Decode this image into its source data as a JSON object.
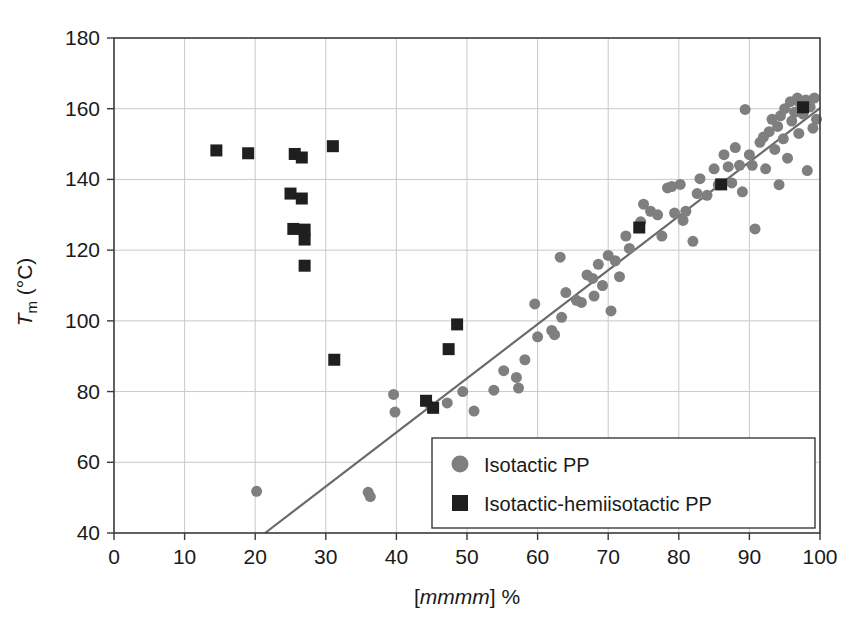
{
  "chart_data": {
    "type": "scatter",
    "title": "",
    "xlabel": "[mmmm] %",
    "xlabel_italic_part": "mmmm",
    "ylabel": "Tm (°C)",
    "ylabel_main": "T",
    "ylabel_subscript": "m",
    "ylabel_unit": "(°C)",
    "xlim": [
      0,
      100
    ],
    "ylim": [
      40,
      180
    ],
    "xticks": [
      0,
      10,
      20,
      30,
      40,
      50,
      60,
      70,
      80,
      90,
      100
    ],
    "yticks": [
      40,
      60,
      80,
      100,
      120,
      140,
      160,
      180
    ],
    "grid": true,
    "grid_color": "#c9c9c9",
    "frame_color": "#3a3a3a",
    "legend_position": "bottom-right",
    "series": [
      {
        "name": "Isotactic PP",
        "marker": "circle",
        "color": "#7f7f7f",
        "marker_size": 11,
        "points": [
          [
            20.2,
            51.8
          ],
          [
            36.0,
            51.5
          ],
          [
            36.3,
            50.3
          ],
          [
            39.6,
            79.2
          ],
          [
            39.8,
            74.2
          ],
          [
            44.8,
            76.0
          ],
          [
            47.2,
            76.8
          ],
          [
            49.4,
            80.0
          ],
          [
            53.8,
            80.4
          ],
          [
            55.2,
            85.9
          ],
          [
            57.0,
            84.0
          ],
          [
            57.3,
            81.0
          ],
          [
            58.2,
            89.0
          ],
          [
            59.6,
            104.8
          ],
          [
            60.0,
            95.5
          ],
          [
            62.0,
            97.3
          ],
          [
            62.4,
            96.1
          ],
          [
            63.2,
            118.0
          ],
          [
            63.4,
            101.0
          ],
          [
            64.0,
            108.0
          ],
          [
            65.5,
            105.8
          ],
          [
            66.2,
            105.2
          ],
          [
            67.0,
            113.0
          ],
          [
            67.8,
            112.0
          ],
          [
            68.6,
            116.0
          ],
          [
            69.2,
            110.0
          ],
          [
            70.0,
            118.5
          ],
          [
            70.4,
            102.8
          ],
          [
            71.0,
            117.0
          ],
          [
            71.6,
            112.5
          ],
          [
            72.5,
            124.0
          ],
          [
            73.0,
            120.5
          ],
          [
            74.6,
            128.0
          ],
          [
            75.0,
            133.0
          ],
          [
            76.0,
            131.0
          ],
          [
            77.0,
            130.0
          ],
          [
            77.6,
            124.0
          ],
          [
            78.4,
            137.6
          ],
          [
            79.0,
            138.0
          ],
          [
            79.4,
            130.5
          ],
          [
            80.2,
            138.6
          ],
          [
            80.6,
            128.4
          ],
          [
            81.0,
            131.0
          ],
          [
            82.0,
            122.5
          ],
          [
            83.0,
            140.2
          ],
          [
            84.0,
            135.5
          ],
          [
            85.0,
            143.0
          ],
          [
            85.6,
            138.5
          ],
          [
            86.4,
            147.0
          ],
          [
            87.0,
            143.6
          ],
          [
            87.5,
            139.0
          ],
          [
            88.0,
            149.0
          ],
          [
            88.6,
            144.0
          ],
          [
            89.0,
            136.5
          ],
          [
            89.4,
            159.8
          ],
          [
            90.0,
            147.0
          ],
          [
            90.4,
            144.0
          ],
          [
            90.8,
            126.0
          ],
          [
            91.5,
            150.5
          ],
          [
            92.0,
            152.0
          ],
          [
            92.3,
            143.0
          ],
          [
            92.8,
            153.5
          ],
          [
            93.2,
            157.0
          ],
          [
            93.6,
            148.5
          ],
          [
            94.0,
            155.0
          ],
          [
            94.4,
            158.0
          ],
          [
            94.8,
            151.5
          ],
          [
            95.0,
            160.0
          ],
          [
            95.4,
            146.0
          ],
          [
            95.8,
            162.0
          ],
          [
            96.0,
            156.5
          ],
          [
            96.4,
            159.0
          ],
          [
            96.8,
            163.0
          ],
          [
            97.0,
            153.0
          ],
          [
            97.2,
            161.5
          ],
          [
            97.6,
            158.5
          ],
          [
            98.0,
            162.5
          ],
          [
            98.2,
            142.5
          ],
          [
            98.6,
            160.5
          ],
          [
            99.0,
            154.5
          ],
          [
            99.2,
            163.0
          ],
          [
            99.5,
            157.0
          ],
          [
            94.2,
            138.5
          ],
          [
            82.6,
            136.0
          ],
          [
            68.0,
            107.0
          ],
          [
            51.0,
            74.5
          ]
        ]
      },
      {
        "name": "Isotactic-hemiisotactic PP",
        "marker": "square",
        "color": "#1f1f1f",
        "marker_size": 12,
        "points": [
          [
            14.5,
            148.2
          ],
          [
            19.0,
            147.4
          ],
          [
            25.6,
            147.2
          ],
          [
            26.6,
            146.2
          ],
          [
            31.0,
            149.4
          ],
          [
            25.0,
            136.0
          ],
          [
            26.6,
            134.6
          ],
          [
            25.4,
            126.0
          ],
          [
            27.0,
            125.8
          ],
          [
            27.0,
            123.0
          ],
          [
            27.0,
            115.6
          ],
          [
            31.2,
            89.0
          ],
          [
            48.6,
            99.0
          ],
          [
            47.4,
            92.0
          ],
          [
            44.2,
            77.4
          ],
          [
            45.2,
            75.4
          ],
          [
            74.4,
            126.4
          ],
          [
            86.0,
            138.6
          ],
          [
            97.6,
            160.4
          ]
        ]
      }
    ],
    "trendline": {
      "x_start": 21.4,
      "y_start": 40,
      "x_end": 100.0,
      "y_end": 160.2,
      "color": "#6a6a6a"
    }
  },
  "legend": {
    "entries": [
      {
        "label": "Isotactic PP",
        "marker": "circle",
        "color": "#7f7f7f"
      },
      {
        "label": "Isotactic-hemiisotactic PP",
        "marker": "square",
        "color": "#1f1f1f"
      }
    ]
  },
  "axis_tick_labels": {
    "x": [
      "0",
      "10",
      "20",
      "30",
      "40",
      "50",
      "60",
      "70",
      "80",
      "90",
      "100"
    ],
    "y": [
      "40",
      "60",
      "80",
      "100",
      "120",
      "140",
      "160",
      "180"
    ]
  }
}
